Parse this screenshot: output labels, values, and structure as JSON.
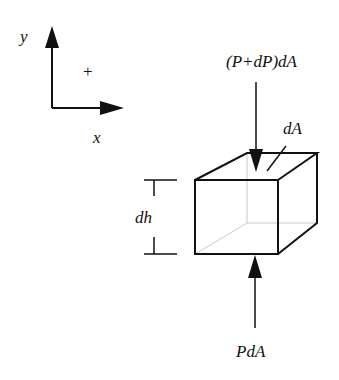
{
  "axes": {
    "y_label": "y",
    "x_label": "x",
    "sign_label": "+"
  },
  "forces": {
    "top_label": "(P+dP)dA",
    "bottom_label": "PdA"
  },
  "element": {
    "area_label": "dA",
    "height_label": "dh"
  },
  "colors": {
    "stroke": "#111111",
    "hidden_edge": "#c8c8c8"
  }
}
